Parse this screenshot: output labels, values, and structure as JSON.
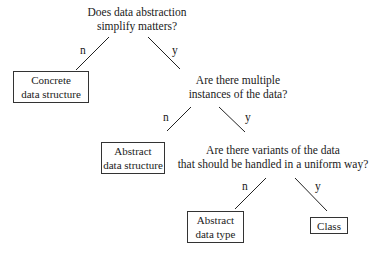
{
  "diagram": {
    "type": "decision-tree",
    "nodes": {
      "q1": {
        "line1": "Does data abstraction",
        "line2": "simplify matters?"
      },
      "q2": {
        "line1": "Are there multiple",
        "line2": "instances of the data?"
      },
      "q3": {
        "line1": "Are there variants of the data",
        "line2": "that should be handled in a uniform way?"
      },
      "concrete": {
        "line1": "Concrete",
        "line2": "data structure"
      },
      "ads": {
        "line1": "Abstract",
        "line2": "data structure"
      },
      "adt": {
        "line1": "Abstract",
        "line2": "data type"
      },
      "class": {
        "line1": "Class"
      }
    },
    "edges": [
      {
        "from": "q1",
        "to": "concrete",
        "label": "n"
      },
      {
        "from": "q1",
        "to": "q2",
        "label": "y"
      },
      {
        "from": "q2",
        "to": "ads",
        "label": "n"
      },
      {
        "from": "q2",
        "to": "q3",
        "label": "y"
      },
      {
        "from": "q3",
        "to": "adt",
        "label": "n"
      },
      {
        "from": "q3",
        "to": "class",
        "label": "y"
      }
    ]
  }
}
